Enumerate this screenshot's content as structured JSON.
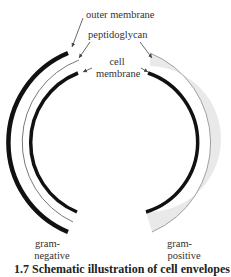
{
  "diagram": {
    "labels": {
      "outer_membrane": "outer membrane",
      "peptidoglycan": "peptidoglycan",
      "cell_membrane_line1": "cell",
      "cell_membrane_line2": "membrane",
      "gram_negative_line1": "gram-",
      "gram_negative_line2": "negative",
      "gram_positive_line1": "gram-",
      "gram_positive_line2": "positive"
    },
    "caption": "1.7  Schematic illustration of cell envelopes",
    "colors": {
      "membrane": "#111111",
      "peptidoglycan_fill": "#e9e9e9",
      "peptidoglycan_edge": "#888888",
      "arrow": "#444444"
    }
  }
}
